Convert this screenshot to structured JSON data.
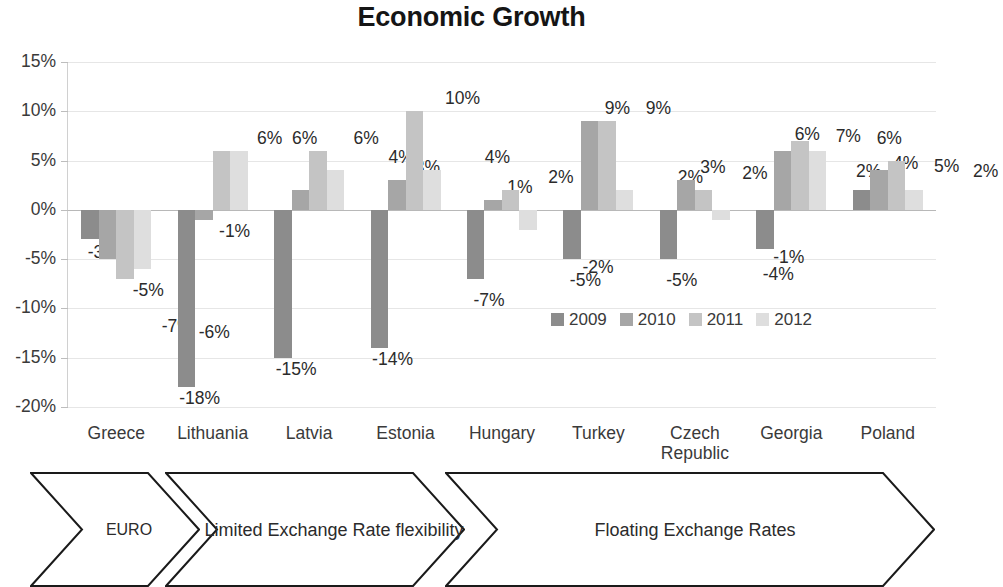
{
  "chart_data": {
    "type": "bar",
    "title": "Economic Growth",
    "xlabel": "",
    "ylabel": "",
    "ylim": [
      -20,
      15
    ],
    "ytick_labels": [
      "15%",
      "10%",
      "5%",
      "0%",
      "-5%",
      "-10%",
      "-15%",
      "-20%"
    ],
    "ytick_values": [
      15,
      10,
      5,
      0,
      -5,
      -10,
      -15,
      -20
    ],
    "grid": true,
    "legend_position": "inside-center-right",
    "value_suffix": "%",
    "categories": [
      "Greece",
      "Lithuania",
      "Latvia",
      "Estonia",
      "Hungary",
      "Turkey",
      "Czech Republic",
      "Georgia",
      "Poland"
    ],
    "series": [
      {
        "name": "2009",
        "color": "#8c8c8c",
        "values": [
          -3,
          -18,
          -15,
          -14,
          -7,
          -5,
          -5,
          -4,
          2
        ]
      },
      {
        "name": "2010",
        "color": "#a6a6a6",
        "values": [
          -5,
          -1,
          2,
          3,
          1,
          9,
          3,
          6,
          4
        ]
      },
      {
        "name": "2011",
        "color": "#c4c4c4",
        "values": [
          -7,
          6,
          6,
          10,
          2,
          9,
          2,
          7,
          5
        ]
      },
      {
        "name": "2012",
        "color": "#dedede",
        "values": [
          -6,
          6,
          4,
          4,
          -2,
          2,
          -1,
          6,
          2
        ]
      }
    ],
    "data_labels": [
      [
        "-3%",
        "-5%",
        "-7%",
        "-6%"
      ],
      [
        "-18%",
        "-1%",
        "6%",
        "6%"
      ],
      [
        "-15%",
        "2%",
        "6%",
        "4%"
      ],
      [
        "-14%",
        "3%",
        "10%",
        "4%"
      ],
      [
        "-7%",
        "1%",
        "2%",
        "-2%"
      ],
      [
        "-5%",
        "9%",
        "9%",
        "2%"
      ],
      [
        "-5%",
        "3%",
        "2%",
        "-1%"
      ],
      [
        "-4%",
        "6%",
        "7%",
        "6%"
      ],
      [
        "2%",
        "4%",
        "5%",
        "2%"
      ]
    ]
  },
  "banner": {
    "segments": [
      {
        "label": "EURO"
      },
      {
        "label": "Limited Exchange Rate flexibility"
      },
      {
        "label": "Floating Exchange Rates"
      }
    ],
    "stroke_color": "#1a1a1a"
  }
}
